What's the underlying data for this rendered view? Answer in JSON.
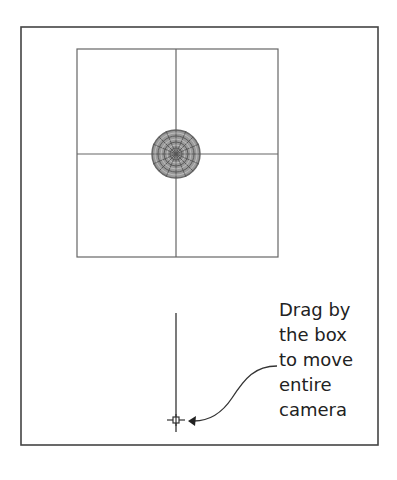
{
  "diagram": {
    "type": "camera-viewport-illustration",
    "colors": {
      "frame": "#444444",
      "grid": "#666666",
      "target_sphere": "#707070",
      "text": "#222222",
      "background": "#ffffff"
    },
    "outer_frame": {
      "x": 21,
      "y": 27,
      "width": 357,
      "height": 418
    },
    "view_grid": {
      "x": 77,
      "y": 49,
      "width": 201,
      "height": 208,
      "center_x": 176,
      "center_y": 154
    },
    "target_sphere": {
      "cx": 176,
      "cy": 154,
      "r": 24,
      "label": "camera-target"
    },
    "camera_line": {
      "x": 176,
      "y_top": 313,
      "y_bottom": 432
    },
    "camera_box": {
      "cx": 176,
      "cy": 420,
      "size": 6
    },
    "callout": {
      "lines": [
        "Drag by",
        "the box",
        "to move",
        "entire",
        "camera"
      ]
    }
  }
}
